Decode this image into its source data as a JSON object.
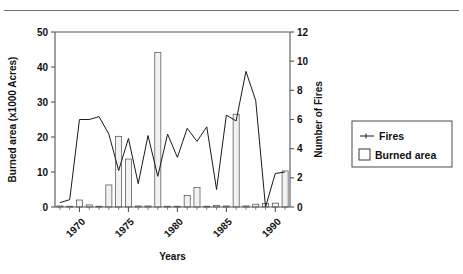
{
  "figure": {
    "has_top_rule": true,
    "background_color": "#ffffff"
  },
  "legend": {
    "position": "right-outside",
    "entries": [
      {
        "label": "Fires",
        "marker": "line-with-point",
        "color": "#1a1a1a"
      },
      {
        "label": "Burned area",
        "marker": "open-square",
        "color": "#f2f2f2"
      }
    ]
  },
  "chart_data": {
    "type": "bar",
    "title": "",
    "subtitle": "",
    "xlabel": "Years",
    "ylabel": "Burned area (x1000 Acres)",
    "y2label": "Number of Fires",
    "xlim": [
      1967.5,
      1991.5
    ],
    "ylim": [
      0,
      50
    ],
    "y2lim": [
      0,
      12
    ],
    "yticks": [
      0,
      10,
      20,
      30,
      40,
      50
    ],
    "y2ticks": [
      0,
      2,
      4,
      6,
      8,
      10,
      12
    ],
    "xticks": [
      1970,
      1975,
      1980,
      1985,
      1990
    ],
    "xticklabels": [
      "1970",
      "1975",
      "1980",
      "1985",
      "1990"
    ],
    "xtick_rotation": -45,
    "grid": false,
    "x": [
      1968,
      1969,
      1970,
      1971,
      1972,
      1973,
      1974,
      1975,
      1976,
      1977,
      1978,
      1979,
      1980,
      1981,
      1982,
      1983,
      1984,
      1985,
      1986,
      1987,
      1988,
      1989,
      1990,
      1991
    ],
    "series": [
      {
        "name": "Burned area",
        "axis": "left",
        "unit": "x1000 Acres",
        "kind": "bar",
        "values": [
          0.3,
          0.2,
          2.0,
          0.6,
          0.2,
          6.3,
          20.2,
          13.7,
          0.3,
          0.3,
          44.2,
          0.2,
          0.2,
          3.3,
          5.6,
          0.2,
          0.4,
          0.3,
          26.5,
          0.3,
          0.8,
          1.0,
          1.1,
          10.3
        ]
      },
      {
        "name": "Fires",
        "axis": "right",
        "unit": "count",
        "kind": "line",
        "values": [
          0.3,
          0.5,
          6.0,
          6.0,
          6.2,
          5.0,
          2.5,
          4.7,
          1.6,
          4.9,
          2.1,
          5.0,
          3.4,
          5.4,
          4.5,
          5.5,
          1.2,
          6.3,
          5.9,
          9.3,
          7.3,
          0.0,
          2.3,
          2.4
        ]
      }
    ]
  }
}
